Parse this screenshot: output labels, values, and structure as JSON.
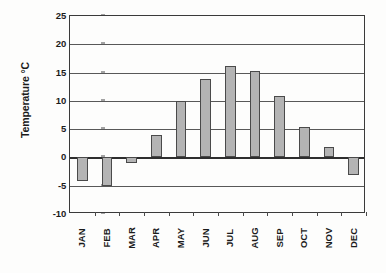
{
  "chart_data": {
    "type": "bar",
    "title": "",
    "xlabel": "",
    "ylabel": "Temperature °C",
    "categories": [
      "JAN",
      "FEB",
      "MAR",
      "APR",
      "MAY",
      "JUN",
      "JUL",
      "AUG",
      "SEP",
      "OCT",
      "NOV",
      "DEC"
    ],
    "values": [
      -4.1,
      -5.0,
      -1.0,
      3.9,
      10.0,
      13.8,
      16.2,
      15.3,
      10.8,
      5.4,
      1.8,
      -3.1
    ],
    "ylim": [
      -10,
      25
    ],
    "ytick_labels": [
      "25",
      "20",
      "15",
      "10",
      "5",
      "0",
      "-5",
      "-10"
    ],
    "ytick_values": [
      25,
      20,
      15,
      10,
      5,
      0,
      -5,
      -10
    ],
    "grid": true,
    "legend": null,
    "legend_position": "none",
    "bar_color": "#b4b4b4",
    "bar_edge_color": "#4a4a4a",
    "axis_color": "#3a3a3a",
    "text_color": "#1b1b1b",
    "background_color": "#fdfdfc"
  }
}
